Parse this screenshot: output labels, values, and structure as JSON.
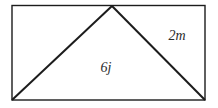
{
  "diagram": {
    "type": "geometry-figure",
    "labels": {
      "slant_side": "2m",
      "triangle_interior": "6j"
    },
    "colors": {
      "line": "#1c1c1c",
      "background": "#ffffff"
    }
  }
}
